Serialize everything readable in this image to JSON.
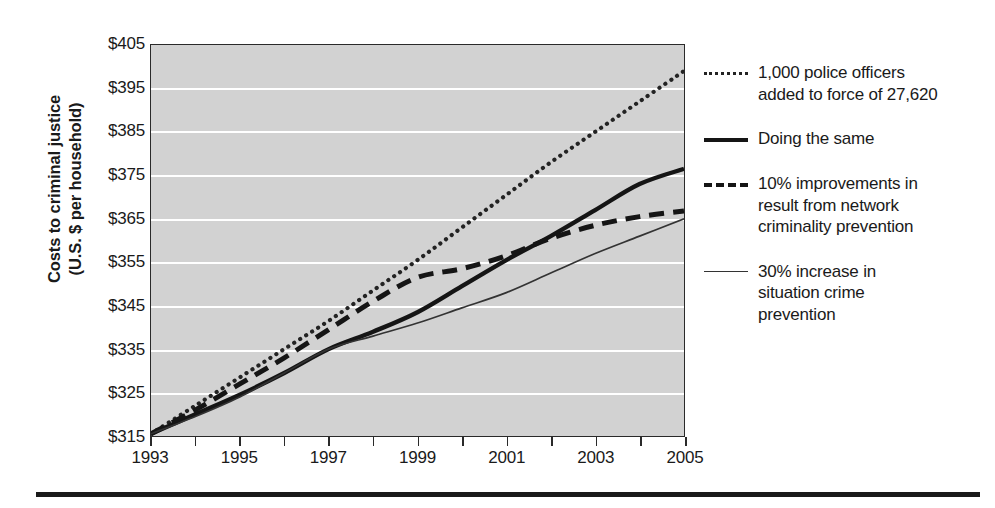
{
  "axis": {
    "ytitle_line1": "Costs to criminal justice",
    "ytitle_line2": "(U.S. $ per household)",
    "ylabels": [
      "$405",
      "$395",
      "$385",
      "$375",
      "$365",
      "$355",
      "$345",
      "$335",
      "$325",
      "$315"
    ],
    "xlabels": [
      "1993",
      "1995",
      "1997",
      "1999",
      "2001",
      "2003",
      "2005"
    ]
  },
  "legend": {
    "items": [
      {
        "marker": "dotted-line-icon",
        "label": "1,000 police officers\nadded to force of 27,620"
      },
      {
        "marker": "solid-thick-line-icon",
        "label": "Doing the same"
      },
      {
        "marker": "dashed-line-icon",
        "label": "10% improvements in\nresult from network\ncriminality prevention"
      },
      {
        "marker": "solid-thin-line-icon",
        "label": "30% increase in\nsituation crime\nprevention"
      }
    ]
  },
  "chart_data": {
    "type": "line",
    "title": "",
    "xlabel": "",
    "ylabel": "Costs to criminal justice (U.S. $ per household)",
    "xlim": [
      1993,
      2005
    ],
    "ylim": [
      315,
      405
    ],
    "ytick_values": [
      315,
      325,
      335,
      345,
      355,
      365,
      375,
      385,
      395,
      405
    ],
    "xtick_values": [
      1993,
      1994,
      1995,
      1996,
      1997,
      1998,
      1999,
      2000,
      2001,
      2002,
      2003,
      2004,
      2005
    ],
    "xtick_labels": [
      "1993",
      "",
      "1995",
      "",
      "1997",
      "",
      "1999",
      "",
      "2001",
      "",
      "2003",
      "",
      "2005"
    ],
    "grid": "horizontal",
    "legend_position": "right",
    "x": [
      1993,
      1994,
      1995,
      1996,
      1997,
      1998,
      1999,
      2000,
      2001,
      2002,
      2003,
      2004,
      2005
    ],
    "series": [
      {
        "name": "1,000 police officers added to force of 27,620",
        "style": "dotted",
        "values": [
          315.5,
          322.0,
          328.5,
          335.0,
          341.5,
          348.5,
          355.5,
          363.0,
          370.5,
          378.0,
          385.0,
          392.0,
          399.0
        ]
      },
      {
        "name": "Doing the same",
        "style": "solid-thick",
        "values": [
          315.5,
          320.0,
          324.5,
          329.5,
          335.0,
          339.0,
          343.5,
          349.5,
          355.5,
          361.0,
          367.0,
          373.0,
          376.5
        ]
      },
      {
        "name": "10% improvements in result from network criminality prevention",
        "style": "dashed",
        "values": [
          315.5,
          321.0,
          327.0,
          333.0,
          339.5,
          346.0,
          351.5,
          353.5,
          356.5,
          360.5,
          363.5,
          365.5,
          366.8
        ]
      },
      {
        "name": "30% increase in situation crime prevention",
        "style": "solid-thin",
        "values": [
          315.5,
          319.5,
          324.0,
          329.5,
          335.0,
          338.0,
          341.0,
          344.5,
          348.0,
          352.5,
          357.0,
          361.0,
          365.0
        ]
      }
    ]
  }
}
